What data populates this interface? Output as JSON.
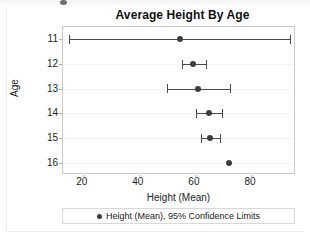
{
  "chart_data": {
    "type": "scatter",
    "title": "Average Height By Age",
    "xlabel": "Height (Mean)",
    "ylabel": "Age",
    "categories": [
      "11",
      "12",
      "13",
      "14",
      "15",
      "16"
    ],
    "xticks": [
      20,
      40,
      60,
      80
    ],
    "xlim": [
      13,
      96
    ],
    "grid": true,
    "legend_position": "bottom",
    "legend": [
      "Height (Mean), 95% Confidence Limits"
    ],
    "series": [
      {
        "name": "Height (Mean), 95% Confidence Limits",
        "marker_color": "#3d3d3d",
        "line_color": "#4a4a4a",
        "points": [
          {
            "category": "11",
            "value": 54.5,
            "lower": 15.0,
            "upper": 94.0,
            "has_error_bar": true
          },
          {
            "category": "12",
            "value": 59.3,
            "lower": 55.2,
            "upper": 64.0,
            "has_error_bar": true
          },
          {
            "category": "13",
            "value": 61.1,
            "lower": 50.2,
            "upper": 72.5,
            "has_error_bar": true
          },
          {
            "category": "14",
            "value": 65.0,
            "lower": 60.5,
            "upper": 69.5,
            "has_error_bar": true
          },
          {
            "category": "15",
            "value": 65.4,
            "lower": 62.3,
            "upper": 68.9,
            "has_error_bar": true
          },
          {
            "category": "16",
            "value": 72.0,
            "lower": null,
            "upper": null,
            "has_error_bar": false
          }
        ]
      }
    ]
  }
}
